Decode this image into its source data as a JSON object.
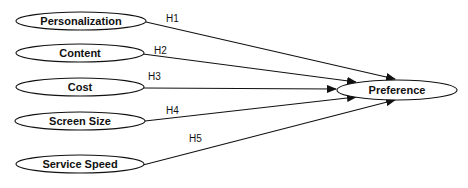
{
  "diagram": {
    "type": "path-model",
    "colors": {
      "stroke": "#111111",
      "background": "#ffffff"
    },
    "independent_variables": [
      {
        "id": "personalization",
        "label": "Personalization"
      },
      {
        "id": "content",
        "label": "Content"
      },
      {
        "id": "cost",
        "label": "Cost"
      },
      {
        "id": "screen_size",
        "label": "Screen Size"
      },
      {
        "id": "service_speed",
        "label": "Service Speed"
      }
    ],
    "dependent_variable": {
      "id": "preference",
      "label": "Preference"
    },
    "hypotheses": [
      {
        "label": "H1",
        "from": "personalization",
        "to": "preference"
      },
      {
        "label": "H2",
        "from": "content",
        "to": "preference"
      },
      {
        "label": "H3",
        "from": "cost",
        "to": "preference"
      },
      {
        "label": "H4",
        "from": "screen_size",
        "to": "preference"
      },
      {
        "label": "H5",
        "from": "service_speed",
        "to": "preference"
      }
    ]
  }
}
